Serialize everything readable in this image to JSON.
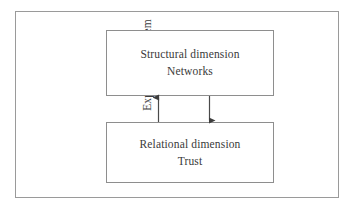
{
  "figure": {
    "frame_label": "Expectation system",
    "background_color": "#ffffff",
    "line_color": "#8e8e8e",
    "text_color": "#3a3a3a"
  },
  "boxes": [
    {
      "id": "structural",
      "line1": "Structural dimension",
      "line2": "Networks"
    },
    {
      "id": "relational",
      "line1": "Relational dimension",
      "line2": "Trust"
    }
  ],
  "arrows": [
    {
      "id": "relational-to-structural",
      "direction": "up",
      "from": "relational",
      "to": "structural"
    },
    {
      "id": "structural-to-relational",
      "direction": "down",
      "from": "structural",
      "to": "relational"
    }
  ]
}
